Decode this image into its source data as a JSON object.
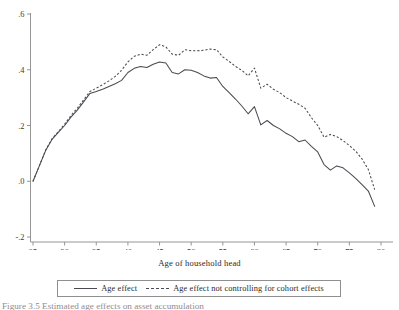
{
  "figure": {
    "xlabel": "Age of household head",
    "caption": "Figure 3.5  Estimated age effects on asset accumulation"
  },
  "legend": {
    "entries": [
      {
        "label": "Age effect",
        "style": "solid"
      },
      {
        "label": "Age effect not controlling for cohort effects",
        "style": "dashed"
      }
    ]
  },
  "chart_data": {
    "type": "line",
    "title": "",
    "xlabel": "Age of household head",
    "ylabel": "",
    "xlim": [
      25,
      80
    ],
    "ylim": [
      -0.2,
      0.6
    ],
    "xticks": [
      25,
      30,
      35,
      40,
      45,
      50,
      55,
      60,
      65,
      70,
      75,
      80
    ],
    "xtick_labels": [
      "25",
      "30",
      "35",
      "40",
      "45",
      "50",
      "55",
      "60",
      "65",
      "70",
      "75",
      "80"
    ],
    "yticks": [
      -0.2,
      0.0,
      0.2,
      0.4,
      0.6
    ],
    "ytick_labels": [
      "-.2",
      ".0",
      ".2",
      ".4",
      ".6"
    ],
    "grid": false,
    "legend_position": "bottom-outside",
    "x": [
      25,
      26,
      27,
      28,
      29,
      30,
      31,
      32,
      33,
      34,
      35,
      36,
      37,
      38,
      39,
      40,
      41,
      42,
      43,
      44,
      45,
      46,
      47,
      48,
      49,
      50,
      51,
      52,
      53,
      54,
      55,
      56,
      57,
      58,
      59,
      60,
      61,
      62,
      63,
      64,
      65,
      66,
      67,
      68,
      69,
      70,
      71,
      72,
      73,
      74,
      75,
      76,
      77,
      78,
      79
    ],
    "series": [
      {
        "name": "Age effect",
        "style": "solid",
        "values": [
          0.0,
          0.055,
          0.11,
          0.15,
          0.175,
          0.2,
          0.23,
          0.255,
          0.285,
          0.315,
          0.322,
          0.33,
          0.34,
          0.35,
          0.362,
          0.39,
          0.405,
          0.412,
          0.408,
          0.42,
          0.428,
          0.424,
          0.39,
          0.385,
          0.4,
          0.398,
          0.39,
          0.378,
          0.37,
          0.372,
          0.34,
          0.318,
          0.295,
          0.27,
          0.242,
          0.268,
          0.202,
          0.218,
          0.2,
          0.188,
          0.172,
          0.16,
          0.142,
          0.148,
          0.125,
          0.105,
          0.06,
          0.04,
          0.055,
          0.048,
          0.03,
          0.01,
          -0.012,
          -0.035,
          -0.09
        ]
      },
      {
        "name": "Age effect not controlling for cohort effects",
        "style": "dashed",
        "values": [
          0.0,
          0.055,
          0.112,
          0.152,
          0.178,
          0.205,
          0.236,
          0.262,
          0.292,
          0.322,
          0.334,
          0.346,
          0.36,
          0.376,
          0.398,
          0.428,
          0.448,
          0.456,
          0.452,
          0.472,
          0.49,
          0.482,
          0.456,
          0.452,
          0.472,
          0.468,
          0.468,
          0.47,
          0.474,
          0.472,
          0.446,
          0.43,
          0.412,
          0.398,
          0.378,
          0.406,
          0.334,
          0.348,
          0.33,
          0.318,
          0.3,
          0.288,
          0.276,
          0.262,
          0.228,
          0.2,
          0.158,
          0.168,
          0.16,
          0.146,
          0.128,
          0.108,
          0.08,
          0.042,
          -0.03
        ]
      }
    ]
  }
}
